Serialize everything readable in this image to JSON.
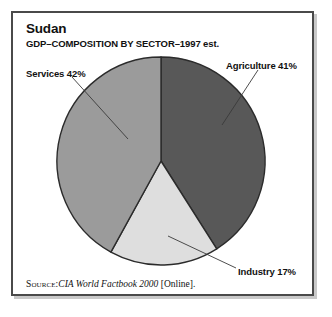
{
  "figure": {
    "title": "Sudan",
    "subtitle": "GDP–COMPOSITION BY SECTOR–1997 est.",
    "source": {
      "keyword": "Source:",
      "title": "CIA World Factbook 2000",
      "suffix": " [Online]."
    },
    "frame_border_color": "#4a4a4a",
    "background_color": "#ffffff"
  },
  "labels": {
    "services": "Services 42%",
    "agriculture": "Agriculture 41%",
    "industry": "Industry 17%"
  },
  "chart_data": {
    "type": "pie",
    "title": "Sudan",
    "subtitle": "GDP–COMPOSITION BY SECTOR–1997 est.",
    "xlabel": "",
    "ylabel": "",
    "categories": [
      "Agriculture",
      "Industry",
      "Services"
    ],
    "values": [
      41,
      17,
      42
    ],
    "unit": "percent",
    "labels": [
      "Agriculture 41%",
      "Industry 17%",
      "Services 42%"
    ],
    "colors": [
      "#585858",
      "#dedede",
      "#9b9b9b"
    ],
    "slice_border_color": "#2b2b2b",
    "start_angle_deg": 0,
    "direction": "clockwise",
    "legend": "none",
    "grid": false,
    "annotations": [
      {
        "text": "Services 42%",
        "position": "upper-left",
        "leader_line": true
      },
      {
        "text": "Agriculture 41%",
        "position": "upper-right",
        "leader_line": true
      },
      {
        "text": "Industry 17%",
        "position": "lower-right",
        "leader_line": true
      }
    ],
    "geometry": {
      "center_x": 161,
      "center_y": 161,
      "radius": 104
    }
  }
}
